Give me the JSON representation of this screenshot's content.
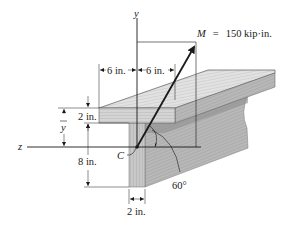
{
  "figure": {
    "type": "T-beam cross section with applied moment",
    "axes": {
      "y_label": "y",
      "z_label": "z"
    },
    "centroid_label": "C",
    "moment": {
      "symbol": "M",
      "equals": "=",
      "value_text": "150 kip·in.",
      "full_label": "M = 150 kip·in."
    },
    "angle_label": "60°",
    "dimensions": {
      "flange_left": "6 in.",
      "flange_right": "6 in.",
      "flange_thickness": "2 in.",
      "web_height": "8 in.",
      "web_thickness": "2 in.",
      "centroid_distance": "y"
    },
    "colors": {
      "wood_light": "#d9d9d9",
      "wood_mid": "#bdbdbd",
      "wood_dark": "#8f8f8f",
      "line": "#1a1a1a",
      "background": "#ffffff"
    }
  }
}
